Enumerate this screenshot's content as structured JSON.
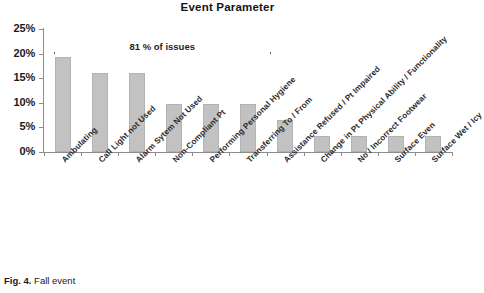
{
  "figure": {
    "caption_number": "Fig. 4.",
    "caption_text": "Fall event"
  },
  "chart_data": {
    "type": "bar",
    "title": "Event Parameter",
    "xlabel": "",
    "ylabel": "",
    "ylim": [
      0,
      25
    ],
    "grid": false,
    "legend": "none",
    "ytick_labels": [
      "0%",
      "5%",
      "10%",
      "15%",
      "20%",
      "25%"
    ],
    "ytick_values": [
      0,
      5,
      10,
      15,
      20,
      25
    ],
    "categories": [
      "Ambulating",
      "Call Light not Used",
      "Alarm Sytem Not Used",
      "Non-Compliant Pt",
      "Performing Personal Hygiene",
      "Transferring To / From",
      "Assistance Refused / Pt Impaired",
      "Change in Pt Physical Ability / Functionality",
      "No / Incorrect Footwear",
      "Surface Even",
      "Surface Wet / Icy"
    ],
    "values": [
      19.4,
      16.1,
      16.1,
      9.7,
      9.7,
      9.7,
      6.5,
      3.2,
      3.2,
      3.2,
      3.2
    ],
    "annotations": [
      {
        "text": "81 % of issues",
        "type": "bracket",
        "covers_categories": [
          "Ambulating",
          "Call Light not Used",
          "Alarm Sytem Not Used",
          "Non-Compliant Pt",
          "Performing Personal Hygiene",
          "Transferring To / From"
        ]
      }
    ],
    "colors": {
      "bar_fill": "#c2c2c2",
      "bar_edge": "#b3b3b3",
      "axis": "#8c8c8c",
      "text": "#1a1a1a",
      "background": "#ffffff"
    }
  }
}
